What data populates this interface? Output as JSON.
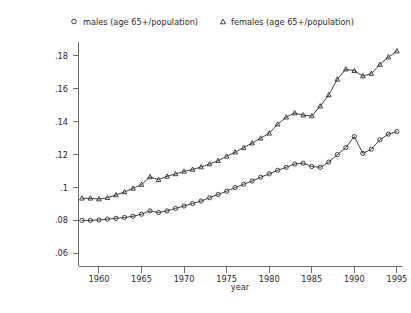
{
  "chart_data": {
    "type": "line",
    "title": "",
    "xlabel": "year",
    "ylabel": "",
    "xlim": [
      1957.6,
      1995.6
    ],
    "ylim": [
      0.052,
      0.1885
    ],
    "grid": false,
    "legend_position": "top",
    "x_ticks": [
      "1960",
      "1965",
      "1970",
      "1975",
      "1980",
      "1985",
      "1990",
      "1995"
    ],
    "x_tick_values": [
      1960,
      1965,
      1970,
      1975,
      1980,
      1985,
      1990,
      1995
    ],
    "y_ticks": [
      ".06",
      ".08",
      ".1",
      ".12",
      ".14",
      ".16",
      ".18"
    ],
    "y_tick_values": [
      0.06,
      0.08,
      0.1,
      0.12,
      0.14,
      0.16,
      0.18
    ],
    "x": [
      1958,
      1959,
      1960,
      1961,
      1962,
      1963,
      1964,
      1965,
      1966,
      1967,
      1968,
      1969,
      1970,
      1971,
      1972,
      1973,
      1974,
      1975,
      1976,
      1977,
      1978,
      1979,
      1980,
      1981,
      1982,
      1983,
      1984,
      1985,
      1986,
      1987,
      1988,
      1989,
      1990,
      1991,
      1992,
      1993,
      1994,
      1995
    ],
    "series": [
      {
        "name": "males (age 65+/population)",
        "marker": "circle",
        "values": [
          0.08,
          0.08,
          0.0803,
          0.0808,
          0.0813,
          0.0818,
          0.0825,
          0.0838,
          0.0858,
          0.0848,
          0.0858,
          0.0873,
          0.0888,
          0.0903,
          0.0918,
          0.0938,
          0.0958,
          0.0978,
          0.1,
          0.102,
          0.104,
          0.1063,
          0.1083,
          0.1105,
          0.1123,
          0.1143,
          0.1148,
          0.1128,
          0.1123,
          0.1155,
          0.12,
          0.1243,
          0.131,
          0.1208,
          0.1233,
          0.129,
          0.1325,
          0.134
        ]
      },
      {
        "name": "females (age 65+/population)",
        "marker": "triangle",
        "values": [
          0.0935,
          0.0935,
          0.093,
          0.0938,
          0.0955,
          0.0973,
          0.0995,
          0.1018,
          0.1065,
          0.1048,
          0.1068,
          0.1083,
          0.1098,
          0.111,
          0.1125,
          0.1143,
          0.1163,
          0.119,
          0.1215,
          0.1243,
          0.127,
          0.13,
          0.133,
          0.1385,
          0.1428,
          0.1453,
          0.144,
          0.1435,
          0.1495,
          0.1563,
          0.1658,
          0.172,
          0.171,
          0.1678,
          0.1693,
          0.1748,
          0.1793,
          0.183
        ]
      }
    ]
  },
  "legend": {
    "entries": [
      {
        "marker": "circle-marker",
        "label": "males (age 65+/population)"
      },
      {
        "marker": "triangle-marker",
        "label": "females (age 65+/population)"
      }
    ]
  },
  "axes": {
    "x_title": "year"
  }
}
